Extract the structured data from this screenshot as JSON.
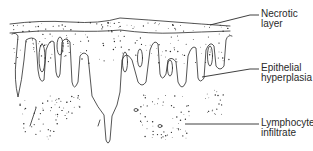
{
  "figure": {
    "labels": [
      {
        "id": "necrotic",
        "line1": "Necrotic",
        "line2": "layer"
      },
      {
        "id": "epithelial",
        "line1": "Epithelial",
        "line2": "hyperplasia"
      },
      {
        "id": "lymph",
        "line1": "Lymphocyte",
        "line2": "infiltrate"
      }
    ],
    "colors": {
      "ink": "#2a2a2a",
      "background": "#ffffff"
    }
  }
}
